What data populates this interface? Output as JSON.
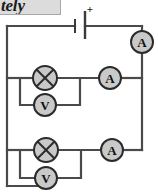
{
  "page": {
    "width": 158,
    "height": 193,
    "background": "#ffffff",
    "title_fragment": "tely"
  },
  "diagram": {
    "type": "electrical-circuit-schematic",
    "colors": {
      "wire": "#4a4a4a",
      "component_fill": "#c9c9c9",
      "component_stroke": "#2b2b2b",
      "label_text": "#111111"
    },
    "geometry": {
      "left_rail_x": 7,
      "right_rail_x": 142,
      "top_rail_y": 26,
      "bottom_rail_y": 186,
      "branch_top_y": 78,
      "branch_bottom_y": 150,
      "voltmeter_top_y": 105,
      "voltmeter_bottom_y": 178,
      "inner_left_x": 20,
      "inner_right_x": 80
    },
    "components": [
      {
        "id": "battery",
        "name": "battery",
        "symbol": "cell",
        "terminal_label": "+",
        "x": 80,
        "y": 26
      },
      {
        "id": "ammeter-main",
        "name": "ammeter",
        "symbol": "circle-meter",
        "label": "A",
        "cx": 142,
        "cy": 42,
        "r": 11
      },
      {
        "id": "lamp-top",
        "name": "lamp",
        "symbol": "circle-cross",
        "label": "",
        "cx": 45,
        "cy": 78,
        "r": 12
      },
      {
        "id": "voltmeter-top",
        "name": "voltmeter",
        "symbol": "circle-meter",
        "label": "V",
        "cx": 45,
        "cy": 105,
        "r": 11
      },
      {
        "id": "ammeter-top",
        "name": "ammeter",
        "symbol": "circle-meter",
        "label": "A",
        "cx": 110,
        "cy": 78,
        "r": 11
      },
      {
        "id": "lamp-bottom",
        "name": "lamp",
        "symbol": "circle-cross",
        "label": "",
        "cx": 46,
        "cy": 150,
        "r": 12
      },
      {
        "id": "voltmeter-bottom",
        "name": "voltmeter",
        "symbol": "circle-meter",
        "label": "V",
        "cx": 46,
        "cy": 178,
        "r": 11
      },
      {
        "id": "ammeter-bottom",
        "name": "ammeter",
        "symbol": "circle-meter",
        "label": "A",
        "cx": 112,
        "cy": 150,
        "r": 11
      }
    ],
    "labels": {
      "ammeter_main": "A",
      "ammeter_top": "A",
      "ammeter_bottom": "A",
      "voltmeter_top": "V",
      "voltmeter_bottom": "V",
      "battery_plus": "+"
    }
  }
}
